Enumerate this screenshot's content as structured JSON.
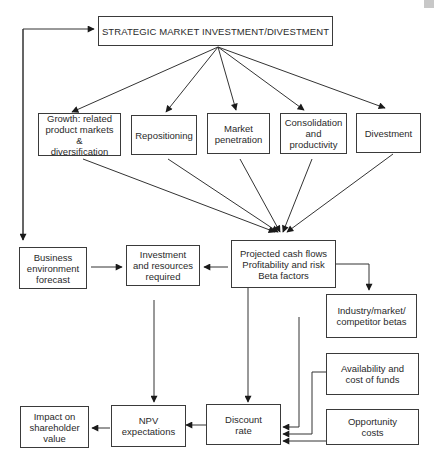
{
  "diagram": {
    "title": "STRATEGIC MARKET INVESTMENT/DIVESTMENT",
    "strategies": [
      {
        "id": "growth",
        "label": "Growth: related\nproduct markets &\ndiversification"
      },
      {
        "id": "repositioning",
        "label": "Repositioning"
      },
      {
        "id": "market-penetration",
        "label": "Market\npenetration"
      },
      {
        "id": "consolidation",
        "label": "Consolidation\nand\nproductivity"
      },
      {
        "id": "divestment",
        "label": "Divestment"
      }
    ],
    "nodes": {
      "business_environment": "Business\nenvironment\nforecast",
      "investment_resources": "Investment\nand resources\nrequired",
      "projected_cash_flows": "Projected cash flows\nProfitability and risk\nBeta factors",
      "industry_betas": "Industry/market/\ncompetitor betas",
      "availability_funds": "Availability and\ncost of funds",
      "opportunity_costs": "Opportunity\ncosts",
      "discount_rate": "Discount\nrate",
      "npv_expectations": "NPV\nexpectations",
      "shareholder_value": "Impact on\nshareholder\nvalue"
    },
    "edges": [
      [
        "title",
        "growth"
      ],
      [
        "title",
        "repositioning"
      ],
      [
        "title",
        "market-penetration"
      ],
      [
        "title",
        "consolidation"
      ],
      [
        "title",
        "divestment"
      ],
      [
        "growth",
        "projected_cash_flows"
      ],
      [
        "repositioning",
        "projected_cash_flows"
      ],
      [
        "market-penetration",
        "projected_cash_flows"
      ],
      [
        "consolidation",
        "projected_cash_flows"
      ],
      [
        "divestment",
        "projected_cash_flows"
      ],
      [
        "projected_cash_flows",
        "title"
      ],
      [
        "projected_cash_flows",
        "business_environment"
      ],
      [
        "business_environment",
        "investment_resources"
      ],
      [
        "projected_cash_flows",
        "investment_resources"
      ],
      [
        "projected_cash_flows",
        "industry_betas"
      ],
      [
        "investment_resources",
        "npv_expectations"
      ],
      [
        "projected_cash_flows",
        "discount_rate"
      ],
      [
        "industry_betas",
        "discount_rate"
      ],
      [
        "availability_funds",
        "discount_rate"
      ],
      [
        "opportunity_costs",
        "discount_rate"
      ],
      [
        "discount_rate",
        "npv_expectations"
      ],
      [
        "npv_expectations",
        "shareholder_value"
      ]
    ]
  }
}
